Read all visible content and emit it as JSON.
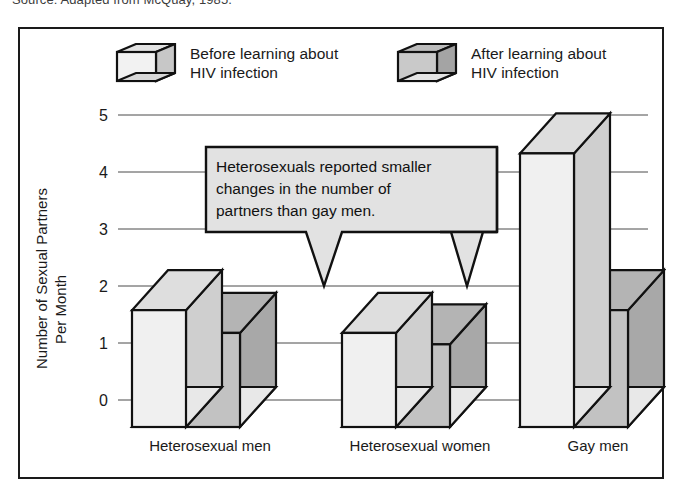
{
  "source_caption": "Source: Adapted from McQuay, 1985.",
  "legend": {
    "position": "top",
    "entries": [
      {
        "label": "Before learning about\nHIV infection",
        "swatch_icon": "cube-3d-light-icon",
        "color": "#ededed"
      },
      {
        "label": "After learning about\nHIV infection",
        "swatch_icon": "cube-3d-dark-icon",
        "color": "#b9b9b9"
      }
    ]
  },
  "callout": {
    "text": "Heterosexuals reported smaller\nchanges in the number of\npartners than gay men.",
    "fill_color": "#e0e0e0",
    "pointer_count": 2
  },
  "chart_data": {
    "type": "bar",
    "title": "",
    "subtitle": "",
    "xlabel": "",
    "ylabel": "Number of Sexual Partners\nPer Month",
    "ylim": [
      0,
      5
    ],
    "yticks": [
      0,
      1,
      2,
      3,
      4,
      5
    ],
    "ytick_labels": [
      "0",
      "1",
      "2",
      "3",
      "4",
      "5"
    ],
    "grid": true,
    "grid_axis": "y",
    "legend_position": "top",
    "style_3d": true,
    "categories": [
      "Heterosexual men",
      "Heterosexual women",
      "Gay men"
    ],
    "series": [
      {
        "name": "Before learning about HIV infection",
        "color": "#ededed",
        "values": [
          2.05,
          1.65,
          4.8
        ]
      },
      {
        "name": "After learning about HIV infection",
        "color": "#b9b9b9",
        "values": [
          1.65,
          1.45,
          2.05
        ]
      }
    ]
  }
}
